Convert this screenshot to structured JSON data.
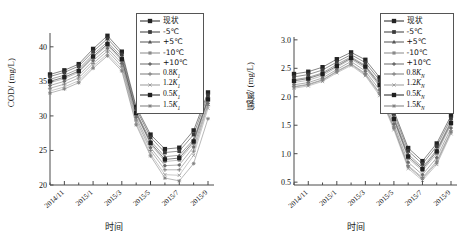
{
  "figure": {
    "background": "#ffffff",
    "series_color": "#2b2b2b",
    "axis_color": "#4a4a4a"
  },
  "panels": [
    {
      "id": "cod",
      "ylabel": "COD/ (mg/L)",
      "xlabel": "时间",
      "legend": [
        {
          "label": "现状",
          "cn": true,
          "marker": "square",
          "size": 3.0,
          "shade": "#232323"
        },
        {
          "label": "-5℃",
          "cn": true,
          "marker": "square",
          "size": 2.6,
          "shade": "#3a3a3a"
        },
        {
          "label": "+5℃",
          "cn": true,
          "marker": "triangle",
          "size": 2.6,
          "shade": "#555555"
        },
        {
          "label": "-10℃",
          "cn": true,
          "marker": "square",
          "size": 2.2,
          "shade": "#8a8a8a"
        },
        {
          "label": "+10℃",
          "cn": true,
          "marker": "diamond",
          "size": 2.4,
          "shade": "#6b6b6b"
        },
        {
          "label": "0.8K₁",
          "cn": false,
          "marker": "plus",
          "size": 2.4,
          "shade": "#7a7a7a"
        },
        {
          "label": "1.2K₁",
          "cn": false,
          "marker": "cross",
          "size": 2.2,
          "shade": "#9a9a9a"
        },
        {
          "label": "0.5K₁",
          "cn": false,
          "marker": "square",
          "size": 3.0,
          "shade": "#1f1f1f"
        },
        {
          "label": "1.5K₁",
          "cn": false,
          "marker": "star",
          "size": 2.4,
          "shade": "#7d7d7d"
        }
      ],
      "chart_data": {
        "type": "line",
        "title": "",
        "xlabel": "时间",
        "ylabel": "COD/ (mg/L)",
        "ylim": [
          20,
          42
        ],
        "yticks": [
          20,
          25,
          30,
          35,
          40
        ],
        "ytick_labels": [
          "20",
          "25",
          "30",
          "35",
          "40"
        ],
        "x": [
          "2014/10",
          "2014/11",
          "2014/12",
          "2015/1",
          "2015/2",
          "2015/3",
          "2015/4",
          "2015/5",
          "2015/6",
          "2015/7",
          "2015/8",
          "2015/9"
        ],
        "xtick_labels": [
          "2014/11",
          "2015/1",
          "2015/3",
          "2015/5",
          "2015/7",
          "2015/9"
        ],
        "xtick_indices": [
          1,
          3,
          5,
          7,
          9,
          11
        ],
        "grid": false,
        "legend_position": "top-right",
        "series": [
          {
            "name": "现状",
            "values": [
              36.0,
              36.6,
              37.5,
              39.7,
              41.6,
              39.3,
              31.3,
              27.3,
              25.2,
              25.4,
              27.9,
              33.4
            ]
          },
          {
            "name": "-5℃",
            "values": [
              35.7,
              36.3,
              37.2,
              39.3,
              41.2,
              38.9,
              31.0,
              26.9,
              24.7,
              24.9,
              27.3,
              33.0
            ]
          },
          {
            "name": "+5℃",
            "values": [
              35.3,
              35.9,
              36.8,
              38.9,
              40.7,
              38.5,
              30.6,
              26.4,
              24.1,
              24.3,
              26.6,
              32.6
            ]
          },
          {
            "name": "-10℃",
            "values": [
              34.8,
              35.4,
              36.3,
              38.4,
              40.2,
              38.0,
              30.2,
              25.9,
              23.4,
              23.6,
              26.0,
              32.2
            ]
          },
          {
            "name": "+10℃",
            "values": [
              34.4,
              35.0,
              35.9,
              38.0,
              39.8,
              37.6,
              29.8,
              25.4,
              22.8,
              22.9,
              25.5,
              31.8
            ]
          },
          {
            "name": "0.8K₁",
            "values": [
              34.0,
              34.6,
              35.5,
              37.6,
              39.4,
              37.2,
              29.4,
              25.0,
              22.2,
              22.2,
              24.9,
              31.5
            ]
          },
          {
            "name": "1.2K₁",
            "values": [
              33.6,
              34.2,
              35.1,
              37.2,
              39.0,
              36.8,
              29.0,
              24.5,
              21.5,
              21.4,
              24.3,
              31.1
            ]
          },
          {
            "name": "0.5K₁",
            "values": [
              35.0,
              35.6,
              36.5,
              38.6,
              40.4,
              38.2,
              30.4,
              26.1,
              23.7,
              23.9,
              26.3,
              32.4
            ]
          },
          {
            "name": "1.5K₁",
            "values": [
              33.3,
              33.9,
              34.8,
              36.9,
              38.7,
              36.5,
              28.7,
              24.2,
              21.0,
              20.6,
              23.1,
              29.6
            ]
          }
        ]
      }
    },
    {
      "id": "ammonia",
      "ylabel": "氨氮/ (mg/L)",
      "xlabel": "时间",
      "legend": [
        {
          "label": "现状",
          "cn": true,
          "marker": "square",
          "size": 3.0,
          "shade": "#232323"
        },
        {
          "label": "-5℃",
          "cn": true,
          "marker": "square",
          "size": 2.6,
          "shade": "#3a3a3a"
        },
        {
          "label": "+5℃",
          "cn": true,
          "marker": "triangle",
          "size": 2.6,
          "shade": "#555555"
        },
        {
          "label": "-10℃",
          "cn": true,
          "marker": "square",
          "size": 2.2,
          "shade": "#8a8a8a"
        },
        {
          "label": "+10℃",
          "cn": true,
          "marker": "diamond",
          "size": 2.4,
          "shade": "#6b6b6b"
        },
        {
          "label": "0.8K_N",
          "cn": false,
          "marker": "plus",
          "size": 2.4,
          "shade": "#7a7a7a"
        },
        {
          "label": "1.2K_N",
          "cn": false,
          "marker": "cross",
          "size": 2.2,
          "shade": "#9a9a9a"
        },
        {
          "label": "0.5K_N",
          "cn": false,
          "marker": "square",
          "size": 3.0,
          "shade": "#1f1f1f"
        },
        {
          "label": "1.5K_N",
          "cn": false,
          "marker": "star",
          "size": 2.4,
          "shade": "#7d7d7d"
        }
      ],
      "chart_data": {
        "type": "line",
        "title": "",
        "xlabel": "时间",
        "ylabel": "氨氮/ (mg/L)",
        "ylim": [
          0.45,
          3.05
        ],
        "yticks": [
          0.5,
          1.0,
          1.5,
          2.0,
          2.5,
          3.0
        ],
        "ytick_labels": [
          "0.5",
          "1.0",
          "1.5",
          "2.0",
          "2.5",
          "3.0"
        ],
        "x": [
          "2014/10",
          "2014/11",
          "2014/12",
          "2015/1",
          "2015/2",
          "2015/3",
          "2015/4",
          "2015/5",
          "2015/6",
          "2015/7",
          "2015/8",
          "2015/9"
        ],
        "xtick_labels": [
          "2014/11",
          "2015/1",
          "2015/3",
          "2015/5",
          "2015/7",
          "2015/9"
        ],
        "xtick_indices": [
          1,
          3,
          5,
          7,
          9,
          11
        ],
        "grid": false,
        "legend_position": "top-right",
        "series": [
          {
            "name": "现状",
            "values": [
              2.4,
              2.44,
              2.52,
              2.66,
              2.78,
              2.65,
              2.34,
              1.75,
              1.1,
              0.87,
              1.18,
              1.67
            ]
          },
          {
            "name": "-5℃",
            "values": [
              2.35,
              2.39,
              2.47,
              2.61,
              2.74,
              2.6,
              2.29,
              1.7,
              1.05,
              0.82,
              1.13,
              1.62
            ]
          },
          {
            "name": "+5℃",
            "values": [
              2.3,
              2.34,
              2.42,
              2.57,
              2.7,
              2.55,
              2.24,
              1.64,
              0.99,
              0.76,
              1.07,
              1.57
            ]
          },
          {
            "name": "-10℃",
            "values": [
              2.25,
              2.29,
              2.37,
              2.52,
              2.66,
              2.5,
              2.18,
              1.58,
              0.92,
              0.7,
              1.0,
              1.51
            ]
          },
          {
            "name": "+10℃",
            "values": [
              2.21,
              2.25,
              2.33,
              2.48,
              2.62,
              2.45,
              2.12,
              1.52,
              0.85,
              0.63,
              0.93,
              1.45
            ]
          },
          {
            "name": "0.8K_N",
            "values": [
              2.18,
              2.22,
              2.3,
              2.45,
              2.58,
              2.41,
              2.07,
              1.47,
              0.79,
              0.58,
              0.87,
              1.4
            ]
          },
          {
            "name": "1.2K_N",
            "values": [
              2.15,
              2.19,
              2.27,
              2.42,
              2.55,
              2.37,
              2.02,
              1.42,
              0.74,
              0.53,
              0.81,
              1.35
            ]
          },
          {
            "name": "0.5K_N",
            "values": [
              2.28,
              2.32,
              2.4,
              2.54,
              2.68,
              2.53,
              2.21,
              1.61,
              0.95,
              0.73,
              1.04,
              1.54
            ]
          },
          {
            "name": "1.5K_N",
            "values": [
              2.17,
              2.21,
              2.29,
              2.44,
              2.57,
              2.39,
              2.05,
              1.45,
              0.77,
              0.56,
              0.84,
              1.38
            ]
          }
        ]
      }
    }
  ]
}
